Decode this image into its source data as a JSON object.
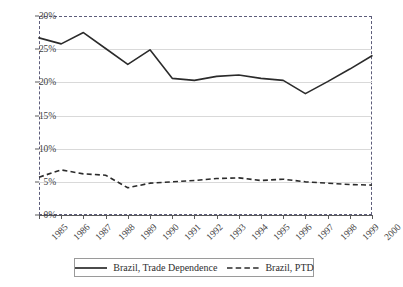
{
  "chart_data": {
    "type": "line",
    "title": "",
    "xlabel": "",
    "ylabel": "",
    "ylim": [
      0,
      30
    ],
    "ytick_labels": [
      "0%",
      "5%",
      "10%",
      "15%",
      "20%",
      "25%",
      "30%"
    ],
    "ytick_values": [
      0,
      5,
      10,
      15,
      20,
      25,
      30
    ],
    "grid": true,
    "legend_position": "bottom",
    "categories": [
      "1985",
      "1986",
      "1987",
      "1988",
      "1989",
      "1990",
      "1991",
      "1992",
      "1993",
      "1994",
      "1995",
      "1996",
      "1997",
      "1998",
      "1999",
      "2000"
    ],
    "series": [
      {
        "name": "Brazil, Trade Dependence",
        "style": "solid",
        "color": "#2b2b2b",
        "values": [
          26.7,
          25.8,
          27.5,
          25.1,
          22.7,
          24.9,
          20.6,
          20.3,
          20.9,
          21.1,
          20.6,
          20.3,
          18.3,
          20.1,
          22.0,
          24.0
        ]
      },
      {
        "name": "Brazil, PTD",
        "style": "dashed",
        "color": "#2b2b2b",
        "values": [
          5.7,
          6.8,
          6.2,
          6.0,
          4.1,
          4.8,
          5.0,
          5.2,
          5.5,
          5.6,
          5.2,
          5.4,
          5.0,
          4.8,
          4.6,
          4.5
        ]
      }
    ]
  },
  "legend": {
    "entries": [
      {
        "label": "Brazil, Trade Dependence",
        "style": "solid"
      },
      {
        "label": "Brazil, PTD",
        "style": "dashed"
      }
    ]
  }
}
